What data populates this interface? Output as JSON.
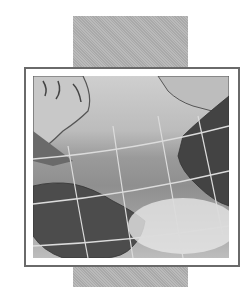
{
  "image": {
    "description": "Grayscale globe map icon showing Atlantic Ocean with Americas and Africa, framed on a vertical gray bar",
    "colors": {
      "bar": "#b4b4b4",
      "frame_border": "#6a6a6a",
      "frame_bg": "#ffffff",
      "land_dark": "#4a4a4a",
      "grid_lines": "#d8d8d8"
    }
  }
}
